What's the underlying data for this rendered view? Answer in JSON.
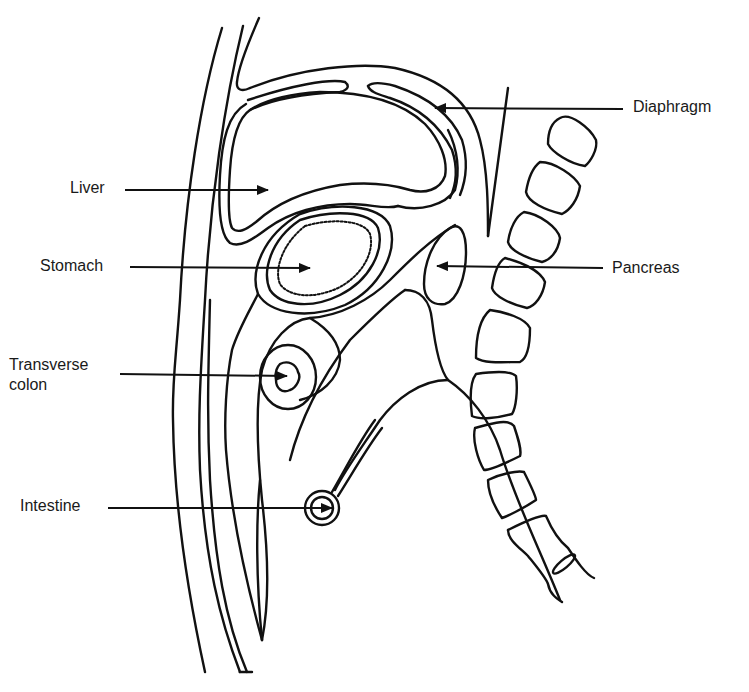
{
  "diagram": {
    "type": "anatomical-sagittal-section",
    "line_color": "#111111",
    "background": "#ffffff",
    "labels": [
      {
        "id": "liver",
        "text": "Liver",
        "x": 70,
        "y": 178,
        "arrow": {
          "x1": 125,
          "y1": 190,
          "x2": 268,
          "y2": 190,
          "dir": "right"
        }
      },
      {
        "id": "stomach",
        "text": "Stomach",
        "x": 40,
        "y": 256,
        "arrow": {
          "x1": 130,
          "y1": 267,
          "x2": 310,
          "y2": 268,
          "dir": "right"
        }
      },
      {
        "id": "transverse_colon",
        "text": "Transverse\ncolon",
        "x": 9,
        "y": 355,
        "arrow": {
          "x1": 120,
          "y1": 374,
          "x2": 287,
          "y2": 376,
          "dir": "right"
        }
      },
      {
        "id": "intestine",
        "text": "Intestine",
        "x": 20,
        "y": 496,
        "arrow": {
          "x1": 108,
          "y1": 508,
          "x2": 332,
          "y2": 508,
          "dir": "right"
        }
      },
      {
        "id": "diaphragm",
        "text": "Diaphragm",
        "x": 633,
        "y": 97,
        "arrow": {
          "x1": 623,
          "y1": 109,
          "x2": 435,
          "y2": 108,
          "dir": "left"
        }
      },
      {
        "id": "pancreas",
        "text": "Pancreas",
        "x": 612,
        "y": 258,
        "arrow": {
          "x1": 603,
          "y1": 268,
          "x2": 437,
          "y2": 266,
          "dir": "left"
        }
      }
    ],
    "partial_top_left_mark": "·"
  }
}
